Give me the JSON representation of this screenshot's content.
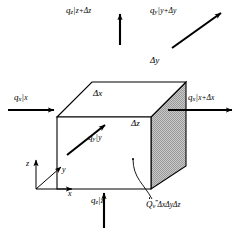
{
  "figure": {
    "kind": "control-volume-energy-balance",
    "background_color": "#ffffff",
    "line_color": "#000000",
    "shaded_face_color": "#b4b4b4"
  },
  "fluxes": {
    "top": {
      "symbol": "q",
      "subscript": "z",
      "evaluated_at": "z+Δz",
      "text_parts": {
        "q": "q",
        "sub": "z",
        "bar": "|",
        "at": "z+Δz"
      },
      "direction": "up"
    },
    "bottom": {
      "symbol": "q",
      "subscript": "z",
      "evaluated_at": "z",
      "text_parts": {
        "q": "q",
        "sub": "z",
        "bar": "|",
        "at": "z"
      },
      "direction": "up"
    },
    "left": {
      "symbol": "q",
      "subscript": "x",
      "evaluated_at": "x",
      "text_parts": {
        "q": "q",
        "sub": "x",
        "bar": "|",
        "at": "x"
      },
      "direction": "right"
    },
    "right": {
      "symbol": "q",
      "subscript": "x",
      "evaluated_at": "x+Δx",
      "text_parts": {
        "q": "q",
        "sub": "x",
        "bar": "|",
        "at": "x+Δx"
      },
      "direction": "right"
    },
    "back": {
      "symbol": "q",
      "subscript": "y",
      "evaluated_at": "y+Δy",
      "text_parts": {
        "q": "q",
        "sub": "y",
        "bar": "|",
        "at": "y+Δy"
      },
      "direction": "up-right-diagonal"
    },
    "front": {
      "symbol": "q",
      "subscript": "y",
      "evaluated_at": "y",
      "text_parts": {
        "q": "q",
        "sub": "y",
        "bar": "|",
        "at": "y"
      },
      "direction": "up-right-diagonal"
    }
  },
  "dimensions": {
    "dx": "Δx",
    "dy": "Δy",
    "dz": "Δz"
  },
  "generation": {
    "symbol": "Q",
    "subscript": "v",
    "superscript": "‴",
    "volume": "ΔxΔyΔz",
    "full_text": "Q̇ᵥ‴ΔxΔyΔz"
  },
  "axes": {
    "z": "z",
    "y": "y",
    "x": "x"
  }
}
